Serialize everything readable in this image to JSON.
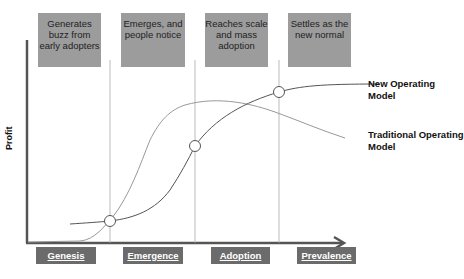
{
  "diagram": {
    "y_axis_label": "Profit",
    "top_boxes": [
      {
        "text": "Generates buzz from early adopters"
      },
      {
        "text": "Emerges, and people notice"
      },
      {
        "text": "Reaches scale and mass adoption"
      },
      {
        "text": "Settles as the new normal"
      }
    ],
    "phases": [
      {
        "label": "Genesis"
      },
      {
        "label": "Emergence"
      },
      {
        "label": "Adoption"
      },
      {
        "label": "Prevalence"
      }
    ],
    "series": [
      {
        "name": "New Operating Model",
        "color": "#555555"
      },
      {
        "name": "Traditional Operating Model",
        "color": "#999999"
      }
    ],
    "intersection_markers": 3
  }
}
